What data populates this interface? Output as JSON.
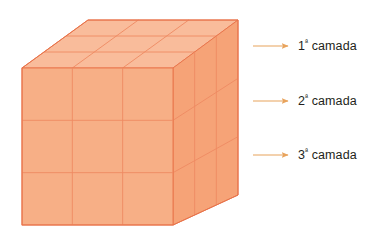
{
  "figure": {
    "cube": {
      "rows": 3,
      "cols": 3,
      "depth": 3,
      "face_color_front": "#F7AF86",
      "face_color_top": "#F9BC9B",
      "face_color_right": "#F6A377",
      "edge_color": "#E8734A",
      "grid_color": "#EE8A62"
    },
    "arrow_color": "#E8A35C",
    "text_color": "#231f20",
    "background": "#ffffff"
  },
  "annotations": [
    {
      "id": "layer-1",
      "number": "1",
      "ordinal": "ª",
      "word": "camada",
      "full_text": "1ª camada"
    },
    {
      "id": "layer-2",
      "number": "2",
      "ordinal": "ª",
      "word": "camada",
      "full_text": "2ª camada"
    },
    {
      "id": "layer-3",
      "number": "3",
      "ordinal": "ª",
      "word": "camada",
      "full_text": "3ª camada"
    }
  ]
}
